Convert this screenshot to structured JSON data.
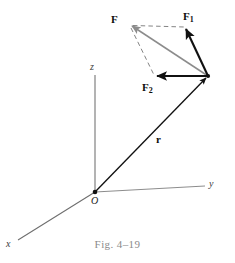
{
  "figure": {
    "caption": "Fig. 4–19",
    "background_color": "#ffffff",
    "labels": {
      "force_resultant": "F",
      "force_one_base": "F",
      "force_one_sub": "1",
      "force_two_base": "F",
      "force_two_sub": "2",
      "position_vector": "r",
      "axis_x": "x",
      "axis_y": "y",
      "axis_z": "z",
      "origin": "O"
    },
    "colors": {
      "vector_black": "#111111",
      "vector_gray": "#8c8c8c",
      "axis_gray": "#6e6e6e",
      "dashed_gray": "#7d7d7d",
      "caption_gray": "#8a8a8a"
    },
    "geometry": {
      "origin_point": [
        95,
        192
      ],
      "application_point": [
        208,
        76
      ],
      "resultant_tip": [
        130,
        25
      ],
      "force_one_tip": [
        185,
        27
      ],
      "force_two_tip": [
        155,
        76
      ],
      "z_axis_top": [
        95,
        75
      ],
      "y_axis_end": [
        205,
        186
      ],
      "x_axis_end": [
        18,
        240
      ]
    }
  }
}
